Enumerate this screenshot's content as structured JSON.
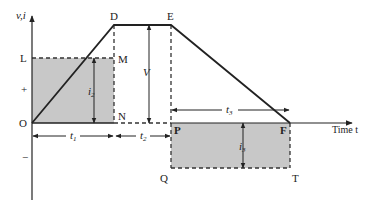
{
  "diagram": {
    "axes": {
      "y_label": "v,i",
      "x_label": "Time t",
      "plus_sign": "+",
      "minus_sign": "−",
      "origin_label": "O"
    },
    "points": {
      "L": "L",
      "M": "M",
      "N": "N",
      "D": "D",
      "E": "E",
      "P": "P",
      "F": "F",
      "Q": "Q",
      "T": "T"
    },
    "dimensions": {
      "i2": "i",
      "i2_sub": "2",
      "i3": "i",
      "i3_sub": "3",
      "V": "V",
      "t1": "t",
      "t1_sub": "1",
      "t2": "t",
      "t2_sub": "2",
      "t3": "t",
      "t3_sub": "3"
    },
    "colors": {
      "line": "#222222",
      "shade": "#c8c8c8",
      "dash": "#333333"
    }
  }
}
